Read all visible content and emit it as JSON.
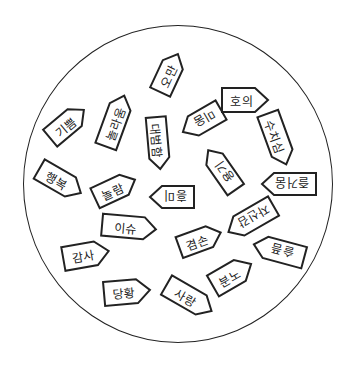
{
  "diagram": {
    "stroke_color": "#222222",
    "fill_color": "#ffffff",
    "tags": [
      {
        "text": "오만",
        "x": 148,
        "y": 62,
        "w": 42,
        "h": 22,
        "rot": -65
      },
      {
        "text": "기쁨",
        "x": 45,
        "y": 113,
        "w": 44,
        "h": 22,
        "rot": -40
      },
      {
        "text": "놀라움",
        "x": 88,
        "y": 110,
        "w": 54,
        "h": 22,
        "rot": -70
      },
      {
        "text": "대범함",
        "x": 132,
        "y": 133,
        "w": 52,
        "h": 20,
        "rot": 85
      },
      {
        "text": "미움",
        "x": 180,
        "y": 110,
        "w": 44,
        "h": 22,
        "rot": 150
      },
      {
        "text": "호의",
        "x": 222,
        "y": 88,
        "w": 46,
        "h": 24,
        "rot": 0
      },
      {
        "text": "수치심",
        "x": 250,
        "y": 128,
        "w": 54,
        "h": 22,
        "rot": 70
      },
      {
        "text": "용기",
        "x": 198,
        "y": 160,
        "w": 48,
        "h": 20,
        "rot": -125
      },
      {
        "text": "행복",
        "x": 36,
        "y": 170,
        "w": 48,
        "h": 22,
        "rot": 30
      },
      {
        "text": "놀람",
        "x": 93,
        "y": 178,
        "w": 44,
        "h": 22,
        "rot": -25
      },
      {
        "text": "흥미",
        "x": 150,
        "y": 186,
        "w": 44,
        "h": 22,
        "rot": 180
      },
      {
        "text": "즐거움",
        "x": 262,
        "y": 173,
        "w": 54,
        "h": 22,
        "rot": 180
      },
      {
        "text": "이슈",
        "x": 102,
        "y": 216,
        "w": 54,
        "h": 22,
        "rot": 5
      },
      {
        "text": "감사",
        "x": 63,
        "y": 243,
        "w": 46,
        "h": 24,
        "rot": -10
      },
      {
        "text": "겸손",
        "x": 178,
        "y": 229,
        "w": 44,
        "h": 22,
        "rot": -20
      },
      {
        "text": "자신감",
        "x": 225,
        "y": 208,
        "w": 52,
        "h": 22,
        "rot": 150
      },
      {
        "text": "슬픔",
        "x": 253,
        "y": 240,
        "w": 52,
        "h": 22,
        "rot": -165
      },
      {
        "text": "분노",
        "x": 210,
        "y": 263,
        "w": 44,
        "h": 24,
        "rot": -30
      },
      {
        "text": "당황",
        "x": 104,
        "y": 280,
        "w": 46,
        "h": 24,
        "rot": -5
      },
      {
        "text": "사랑",
        "x": 163,
        "y": 287,
        "w": 52,
        "h": 22,
        "rot": 30
      }
    ]
  }
}
